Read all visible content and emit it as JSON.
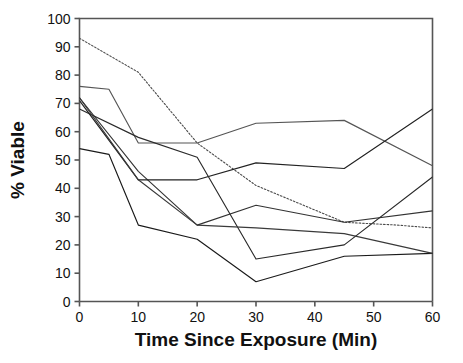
{
  "chart_data": {
    "type": "line",
    "title": "",
    "xlabel": "Time Since Exposure (Min)",
    "ylabel": "% Viable",
    "xlim": [
      0,
      60
    ],
    "ylim": [
      0,
      100
    ],
    "xticks": [
      0,
      10,
      20,
      30,
      40,
      50,
      60
    ],
    "yticks": [
      0,
      10,
      20,
      30,
      40,
      50,
      60,
      70,
      80,
      90,
      100
    ],
    "grid": false,
    "legend": "none",
    "x": [
      0,
      5,
      10,
      20,
      30,
      45,
      60
    ],
    "series": [
      {
        "name": "series-1",
        "style": "dotted",
        "color": "#4a4a4a",
        "points": [
          [
            0,
            93
          ],
          [
            10,
            81
          ],
          [
            20,
            56
          ],
          [
            30,
            41
          ],
          [
            45,
            28
          ],
          [
            54,
            27
          ],
          [
            60,
            26
          ]
        ]
      },
      {
        "name": "series-2",
        "style": "solid",
        "color": "#555555",
        "points": [
          [
            0,
            76
          ],
          [
            5,
            75
          ],
          [
            10,
            56
          ],
          [
            20,
            56
          ],
          [
            30,
            63
          ],
          [
            45,
            64
          ],
          [
            60,
            48
          ]
        ]
      },
      {
        "name": "series-3",
        "style": "solid",
        "color": "#333333",
        "points": [
          [
            0,
            72
          ],
          [
            10,
            46
          ],
          [
            20,
            27
          ],
          [
            30,
            34
          ],
          [
            45,
            28
          ],
          [
            60,
            32
          ]
        ]
      },
      {
        "name": "series-4",
        "style": "solid",
        "color": "#222222",
        "points": [
          [
            0,
            71
          ],
          [
            10,
            43
          ],
          [
            20,
            43
          ],
          [
            30,
            49
          ],
          [
            45,
            47
          ],
          [
            60,
            68
          ]
        ]
      },
      {
        "name": "series-5",
        "style": "solid",
        "color": "#2a2a2a",
        "points": [
          [
            0,
            68
          ],
          [
            10,
            58
          ],
          [
            20,
            51
          ],
          [
            30,
            15
          ],
          [
            45,
            20
          ],
          [
            60,
            44
          ]
        ]
      },
      {
        "name": "series-6",
        "style": "solid",
        "color": "#1a1a1a",
        "points": [
          [
            0,
            54
          ],
          [
            5,
            52
          ],
          [
            10,
            27
          ],
          [
            20,
            22
          ],
          [
            30,
            7
          ],
          [
            45,
            16
          ],
          [
            60,
            17
          ]
        ]
      },
      {
        "name": "series-7",
        "style": "solid",
        "color": "#3a3a3a",
        "points": [
          [
            0,
            72
          ],
          [
            10,
            43
          ],
          [
            20,
            27
          ],
          [
            30,
            26
          ],
          [
            45,
            24
          ],
          [
            60,
            17
          ]
        ]
      }
    ]
  },
  "figure": {
    "xlabel": "Time Since Exposure (Min)",
    "ylabel": "% Viable",
    "xticklabels": [
      "0",
      "10",
      "20",
      "30",
      "40",
      "50",
      "60"
    ],
    "yticklabels": [
      "0",
      "10",
      "20",
      "30",
      "40",
      "50",
      "60",
      "70",
      "80",
      "90",
      "100"
    ],
    "axis_color": "#555555",
    "background": "#ffffff"
  }
}
